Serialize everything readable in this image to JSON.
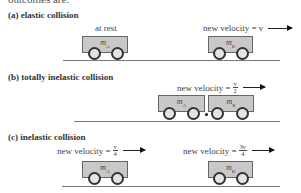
{
  "header": {
    "clipped_text": "outcomes are:"
  },
  "sections": [
    {
      "label": "(a) elastic collision",
      "cart_a": {
        "mass_symbol": "m",
        "subscript": "A",
        "state": "at rest"
      },
      "cart_b": {
        "mass_symbol": "m",
        "subscript": "B",
        "velocity_text": "new velocity = v"
      }
    },
    {
      "label": "(b) totally inelastic collision",
      "combined": {
        "velocity_prefix": "new velocity =",
        "velocity_numerator": "v",
        "velocity_denominator": "2",
        "cart_a": {
          "mass_symbol": "m",
          "subscript": "A"
        },
        "cart_b": {
          "mass_symbol": "m",
          "subscript": "B"
        }
      }
    },
    {
      "label": "(c) inelastic collision",
      "cart_a": {
        "mass_symbol": "m",
        "subscript": "A",
        "velocity_prefix": "new velocity =",
        "velocity_numerator": "v",
        "velocity_denominator": "4"
      },
      "cart_b": {
        "mass_symbol": "m",
        "subscript": "B",
        "velocity_prefix": "new velocity =",
        "velocity_numerator": "3v",
        "velocity_denominator": "4"
      }
    }
  ],
  "colors": {
    "cart_fill": "#c8c8c8",
    "cart_border": "#666666",
    "wheel_fill": "#e4e4e4",
    "ground": "#777777"
  }
}
